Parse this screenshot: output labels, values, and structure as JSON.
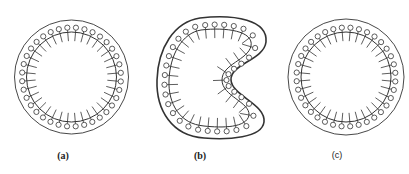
{
  "figure": {
    "stroke_color": "#333333",
    "background": "#ffffff",
    "panels": [
      {
        "id": "a",
        "label": "(a)",
        "shape": "circle",
        "description": "Round vesicle: lipid monolayer (heads outward, tails inward) inside circular membrane",
        "outer": {
          "cx": 71.5,
          "cy": 77,
          "r": 57,
          "stroke_width": 0.9
        },
        "ring": {
          "r": 45,
          "stroke_width": 1.0
        },
        "heads": {
          "count": 36,
          "radius": 2.6,
          "offset": 4.5
        },
        "tails": {
          "length": 9
        },
        "label_pos": {
          "x": 63,
          "y": 150
        }
      },
      {
        "id": "b",
        "label": "(b)",
        "shape": "kidney",
        "description": "Deformed (kidney-shaped) vesicle with indented right side",
        "outer_path": "M 200 18 C 235 14 268 20 266 42 C 264 60 230 64 231 80 C 232 96 266 104 264 122 C 262 138 228 140 204 138 C 172 136 156 110 157 80 C 158 48 174 22 200 18 Z",
        "ring_path": "M 201 30 C 226 27 254 31 251 46 C 248 60 222 64 222 80 C 222 96 250 102 249 115 C 247 128 222 128 204 126 C 180 124 168 104 169 80 C 170 55 182 33 201 30 Z",
        "heads": {
          "count": 36,
          "radius": 2.6,
          "offset": 4.5
        },
        "tails": {
          "length": 9
        },
        "outer_stroke_width": 1.6,
        "label_pos": {
          "x": 200,
          "y": 150
        }
      },
      {
        "id": "c",
        "label": "(c)",
        "shape": "circle",
        "description": "Restored round vesicle after deformation",
        "outer": {
          "cx": 346,
          "cy": 77,
          "r": 58,
          "stroke_width": 0.9
        },
        "ring": {
          "r": 45,
          "stroke_width": 1.0
        },
        "heads": {
          "count": 36,
          "radius": 2.6,
          "offset": 4.5
        },
        "tails": {
          "length": 9
        },
        "label_pos": {
          "x": 337,
          "y": 150
        }
      }
    ]
  }
}
